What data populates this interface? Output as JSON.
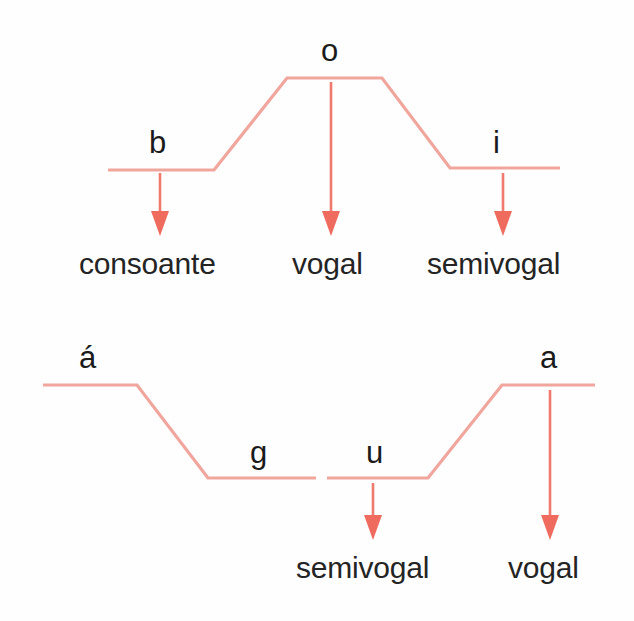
{
  "figure": {
    "background_color": "#fefefe",
    "line_color": "#f0a59d",
    "arrow_color": "#ef6b5e",
    "text_color": "#1b1b1b"
  },
  "diagrams": [
    {
      "id": "upper",
      "phonemes": [
        {
          "text": "b",
          "x": 149,
          "y": 127
        },
        {
          "text": "o",
          "x": 321,
          "y": 35
        },
        {
          "text": "i",
          "x": 493,
          "y": 127
        }
      ],
      "labels": [
        {
          "text": "consoante",
          "x": 79,
          "y": 249
        },
        {
          "text": "vogal",
          "x": 292,
          "y": 249
        },
        {
          "text": "semivogal",
          "x": 427,
          "y": 249
        }
      ],
      "arrows": [
        {
          "x": 160,
          "y1": 173,
          "y2": 233,
          "for": "b"
        },
        {
          "x": 331,
          "y1": 82,
          "y2": 233,
          "for": "o"
        },
        {
          "x": 503,
          "y1": 173,
          "y2": 233,
          "for": "i"
        }
      ],
      "contour_points": "108,170 214,170 287,78 382,78 450,168 560,168"
    },
    {
      "id": "lower",
      "phonemes": [
        {
          "text": "á",
          "x": 79,
          "y": 342
        },
        {
          "text": "g",
          "x": 250,
          "y": 437
        },
        {
          "text": "u",
          "x": 366,
          "y": 437
        },
        {
          "text": "a",
          "x": 540,
          "y": 342
        }
      ],
      "labels": [
        {
          "text": "semivogal",
          "x": 296,
          "y": 553
        },
        {
          "text": "vogal",
          "x": 508,
          "y": 553
        }
      ],
      "arrows": [
        {
          "x": 373,
          "y1": 483,
          "y2": 538,
          "for": "u"
        },
        {
          "x": 550,
          "y1": 390,
          "y2": 538,
          "for": "a"
        }
      ],
      "contour_points_left": "43,385 137,385 208,478 316,478",
      "contour_points_right": "327,478 428,478 502,385 595,385"
    }
  ]
}
